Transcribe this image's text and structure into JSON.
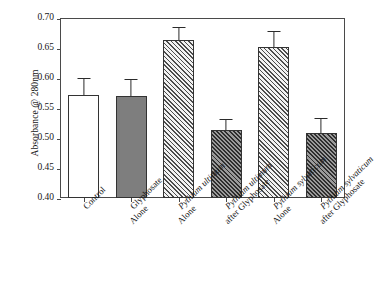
{
  "chart_data": {
    "type": "bar",
    "title": "",
    "xlabel": "",
    "ylabel": "Absorbance @ 280nm",
    "ylim": [
      0.4,
      0.7
    ],
    "yticks": [
      "0.40",
      "0.45",
      "0.50",
      "0.55",
      "0.60",
      "0.65",
      "0.70"
    ],
    "ytick_values": [
      0.4,
      0.45,
      0.5,
      0.55,
      0.6,
      0.65,
      0.7
    ],
    "grid": false,
    "legend": "none",
    "categories": [
      "Control",
      "Glyphosate Alone",
      "Pythium ultimum Alone",
      "Pythium ultimum after Glyphosate",
      "Pythium sylvaticum Alone",
      "Pythium sylvaticum after Glyphosate"
    ],
    "values": [
      0.572,
      0.57,
      0.663,
      0.514,
      0.651,
      0.509
    ],
    "errors": [
      0.028,
      0.028,
      0.022,
      0.018,
      0.027,
      0.024
    ],
    "bar_fills": [
      "open",
      "solid-gray",
      "hatch-light",
      "hatch-dark",
      "hatch-light",
      "hatch-dark"
    ]
  },
  "axes": {
    "y_title": "Absorbance @ 280nm",
    "y_tick_labels": [
      "0.70",
      "0.65",
      "0.60",
      "0.55",
      "0.50",
      "0.45",
      "0.40"
    ]
  },
  "bars": [
    {
      "name": "control",
      "value": 0.572,
      "error": 0.028,
      "fill": "open",
      "label_line1": "Control",
      "label_line2": "",
      "label_italic_line1": false,
      "label_italic_line2": false
    },
    {
      "name": "glyphosate-alone",
      "value": 0.57,
      "error": 0.028,
      "fill": "solid-gray",
      "label_line1": "Glyphosate",
      "label_line2": "Alone",
      "label_italic_line1": false,
      "label_italic_line2": false
    },
    {
      "name": "pythium-ultimum-alone",
      "value": 0.663,
      "error": 0.022,
      "fill": "hatch-light",
      "label_line1": "Pythium ultimum",
      "label_line2": "Alone",
      "label_italic_line1": true,
      "label_italic_line2": false
    },
    {
      "name": "pythium-ultimum-after-glyphosate",
      "value": 0.514,
      "error": 0.018,
      "fill": "hatch-dark",
      "label_line1": "Pythium ultimum",
      "label_line2": "after Glyphosate",
      "label_italic_line1": true,
      "label_italic_line2": false
    },
    {
      "name": "pythium-sylvaticum-alone",
      "value": 0.651,
      "error": 0.027,
      "fill": "hatch-light",
      "label_line1": "Pythium sylvaticum",
      "label_line2": "Alone",
      "label_italic_line1": true,
      "label_italic_line2": false
    },
    {
      "name": "pythium-sylvaticum-after-glyphosate",
      "value": 0.509,
      "error": 0.024,
      "fill": "hatch-dark",
      "label_line1": "Pythium sylvaticum",
      "label_line2": "after Glyphosate",
      "label_italic_line1": true,
      "label_italic_line2": false
    }
  ],
  "colors": {
    "frame": "#4a4a4a",
    "bar_outline": "#333333",
    "solid_gray_fill": "#7e7e7e",
    "hatch_light_bg": "#f2f2f2",
    "hatch_dark_bg": "#9a9a9a",
    "error_bar": "#2b2b2b",
    "text": "#171717",
    "background": "#ffffff"
  }
}
